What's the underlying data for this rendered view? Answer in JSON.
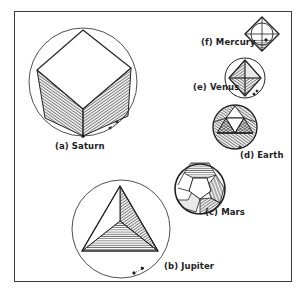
{
  "figure": {
    "type": "platonic-solids-inscribed-in-circles",
    "colors": {
      "line": "#222222",
      "frame": "#3a3a3a",
      "background": "#ffffff"
    },
    "solids": [
      {
        "id": "saturn",
        "label": "(a) Saturn",
        "solid": "cube"
      },
      {
        "id": "jupiter",
        "label": "(b) Jupiter",
        "solid": "tetrahedron"
      },
      {
        "id": "mars",
        "label": "(c) Mars",
        "solid": "dodecahedron"
      },
      {
        "id": "earth",
        "label": "(d) Earth",
        "solid": "icosahedron"
      },
      {
        "id": "venus",
        "label": "(e) Venus",
        "solid": "octahedron"
      },
      {
        "id": "mercury",
        "label": "(f) Mercury",
        "solid": "sphere-in-octahedron"
      }
    ]
  },
  "labels": {
    "saturn": "(a) Saturn",
    "jupiter": "(b) Jupiter",
    "mars": "(c) Mars",
    "earth": "(d) Earth",
    "venus": "(e) Venus",
    "mercury": "(f) Mercury"
  }
}
